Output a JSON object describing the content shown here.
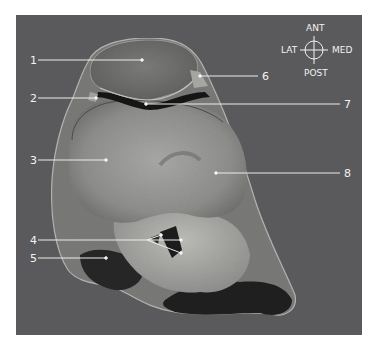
{
  "figure": {
    "background_color": "#5a5a5c",
    "label_color": "#f2f2f2"
  },
  "compass": {
    "top": "ANT",
    "bottom": "POST",
    "left": "LAT",
    "right": "MED"
  },
  "labels": [
    {
      "id": "1",
      "text": "1"
    },
    {
      "id": "2",
      "text": "2"
    },
    {
      "id": "3",
      "text": "3"
    },
    {
      "id": "4",
      "text": "4"
    },
    {
      "id": "5",
      "text": "5"
    },
    {
      "id": "6",
      "text": "6"
    },
    {
      "id": "7",
      "text": "7"
    },
    {
      "id": "8",
      "text": "8"
    }
  ]
}
